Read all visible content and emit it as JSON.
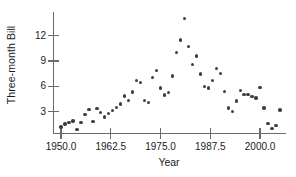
{
  "chart_data": {
    "type": "scatter",
    "title": "",
    "xlabel": "Year",
    "ylabel": "Three-month Bill",
    "xlim": [
      1948.0,
      2006.5
    ],
    "ylim": [
      0.5,
      14.8
    ],
    "xticks": [
      1950.0,
      1962.5,
      1975.0,
      1987.5,
      2000.0
    ],
    "xtick_labels": [
      "1950.0",
      "1962.5",
      "1975.0",
      "1987.5",
      "2000.0"
    ],
    "yticks": [
      3,
      6,
      9,
      12
    ],
    "ytick_labels": [
      "3",
      "6",
      "9",
      "12"
    ],
    "grid": false,
    "legend": null,
    "marker_color": "#3f3f3f",
    "axis_color": "#6b6b6b",
    "background_color": "#ffffff",
    "x": [
      1950.0,
      1951.0,
      1952.0,
      1953.0,
      1954.0,
      1955.0,
      1956.0,
      1957.0,
      1958.0,
      1959.0,
      1960.0,
      1961.0,
      1962.0,
      1963.0,
      1964.0,
      1965.0,
      1966.0,
      1967.0,
      1968.0,
      1969.0,
      1970.0,
      1971.0,
      1972.0,
      1973.0,
      1974.0,
      1975.0,
      1976.0,
      1977.0,
      1978.0,
      1979.0,
      1980.0,
      1981.0,
      1982.0,
      1983.0,
      1984.0,
      1985.0,
      1986.0,
      1987.0,
      1988.0,
      1989.0,
      1990.0,
      1991.0,
      1992.0,
      1993.0,
      1994.0,
      1995.0,
      1996.0,
      1997.0,
      1998.0,
      1999.0,
      2000.0,
      2001.0,
      2002.0,
      2003.0,
      2004.0,
      2005.0
    ],
    "y": [
      1.22,
      1.55,
      1.77,
      1.93,
      0.95,
      1.75,
      2.66,
      3.27,
      1.84,
      3.41,
      2.93,
      2.38,
      2.78,
      3.16,
      3.55,
      3.95,
      4.88,
      4.33,
      5.35,
      6.69,
      6.44,
      4.35,
      4.07,
      7.04,
      7.89,
      5.84,
      4.99,
      5.27,
      7.22,
      10.04,
      11.51,
      14.03,
      10.69,
      8.63,
      9.58,
      7.48,
      5.98,
      5.82,
      6.69,
      8.12,
      7.51,
      5.42,
      3.45,
      3.02,
      4.29,
      5.51,
      5.02,
      5.07,
      4.81,
      4.66,
      5.85,
      3.45,
      1.62,
      1.02,
      1.38,
      3.22
    ],
    "n_points": 56
  },
  "axis_titles": {
    "y": "Three-month Bill",
    "x": "Year"
  }
}
